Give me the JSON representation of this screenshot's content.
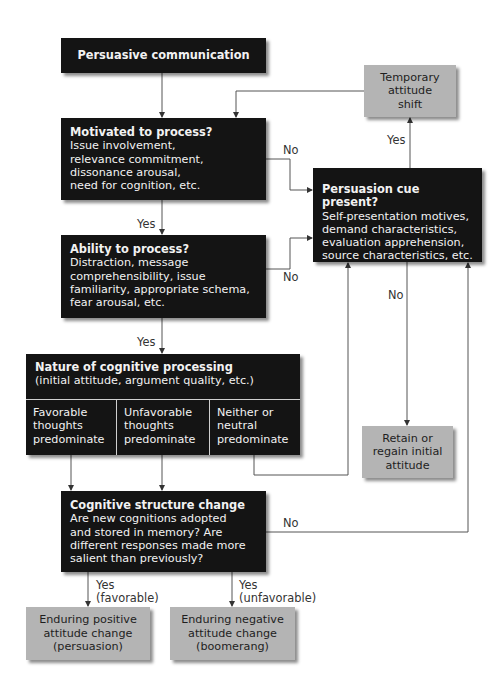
{
  "diagram": {
    "start": {
      "title": "Persuasive communication"
    },
    "motivated": {
      "title": "Motivated to process?",
      "lines": [
        "Issue involvement,",
        "relevance commitment,",
        "dissonance arousal,",
        "need for cognition, etc."
      ]
    },
    "ability": {
      "title": "Ability to process?",
      "lines": [
        "Distraction, message",
        "comprehensibility, issue",
        "familiarity, appropriate schema,",
        "fear arousal, etc."
      ]
    },
    "nature": {
      "title": "Nature of cognitive processing",
      "subtitle": "(initial attitude, argument quality, etc.)",
      "columns": [
        {
          "lines": [
            "Favorable",
            "thoughts",
            "predominate"
          ]
        },
        {
          "lines": [
            "Unfavorable",
            "thoughts",
            "predominate"
          ]
        },
        {
          "lines": [
            "Neither or",
            "neutral",
            "predominate"
          ]
        }
      ]
    },
    "cognitive": {
      "title": "Cognitive structure change",
      "lines": [
        "Are new cognitions adopted",
        "and stored in memory? Are",
        "different responses made more",
        "salient than previously?"
      ]
    },
    "cue": {
      "title": "Persuasion cue present?",
      "lines": [
        "Self-presentation motives,",
        "demand characteristics,",
        "evaluation apprehension,",
        "source characteristics, etc."
      ]
    },
    "temporary": {
      "lines": [
        "Temporary",
        "attitude",
        "shift"
      ]
    },
    "retain": {
      "lines": [
        "Retain or",
        "regain initial",
        "attitude"
      ]
    },
    "positive": {
      "lines": [
        "Enduring positive",
        "attitude change",
        "(persuasion)"
      ]
    },
    "negative": {
      "lines": [
        "Enduring negative",
        "attitude change",
        "(boomerang)"
      ]
    }
  },
  "labels": {
    "yes_motivated": "Yes",
    "no_motivated": "No",
    "yes_ability": "Yes",
    "no_ability": "No",
    "yes_cue": "Yes",
    "no_cue": "No",
    "no_cognitive": "No",
    "yes_fav_1": "Yes",
    "yes_fav_2": "(favorable)",
    "yes_unfav_1": "Yes",
    "yes_unfav_2": "(unfavorable)"
  },
  "colors": {
    "dark_box": "#141414",
    "gray_box": "#b4b4b4",
    "line": "#555555"
  }
}
